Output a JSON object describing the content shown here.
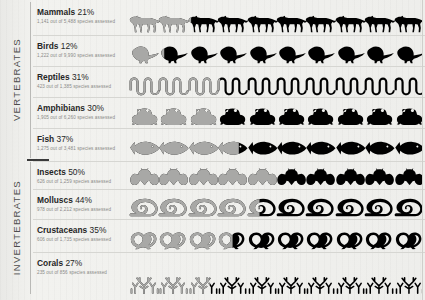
{
  "groups": [
    {
      "label": "VERTEBRATES",
      "name": "group-vertebrates"
    },
    {
      "label": "INVERTEBRATES",
      "name": "group-invertebrates"
    }
  ],
  "rows": [
    {
      "name": "row-mammals",
      "title": "Mammals",
      "percent_label": "21%",
      "percent": 21,
      "subtitle": "1,141 out of 5,488 species assessed",
      "threatened": 1141,
      "assessed": 5488,
      "icon": "wolf-icon",
      "icon_count": 10
    },
    {
      "name": "row-birds",
      "title": "Birds",
      "percent_label": "12%",
      "percent": 12,
      "subtitle": "1,222 out of 9,990 species assessed",
      "threatened": 1222,
      "assessed": 9990,
      "icon": "bird-icon",
      "icon_count": 10
    },
    {
      "name": "row-reptiles",
      "title": "Reptiles",
      "percent_label": "31%",
      "percent": 31,
      "subtitle": "423 out of 1,385 species assessed",
      "threatened": 423,
      "assessed": 1385,
      "icon": "snake-icon",
      "icon_count": 10
    },
    {
      "name": "row-amphibians",
      "title": "Amphibians",
      "percent_label": "30%",
      "percent": 30,
      "subtitle": "1,905 out of 6,260 species assessed",
      "threatened": 1905,
      "assessed": 6260,
      "icon": "frog-icon",
      "icon_count": 10
    },
    {
      "name": "row-fish",
      "title": "Fish",
      "percent_label": "37%",
      "percent": 37,
      "subtitle": "1,275 out of 3,481 species assessed",
      "threatened": 1275,
      "assessed": 3481,
      "icon": "fish-icon",
      "icon_count": 10
    },
    {
      "name": "row-insects",
      "title": "Insects",
      "percent_label": "50%",
      "percent": 50,
      "subtitle": "626 out of 1,259 species assessed",
      "threatened": 626,
      "assessed": 1259,
      "icon": "insect-icon",
      "icon_count": 10
    },
    {
      "name": "row-molluscs",
      "title": "Molluscs",
      "percent_label": "44%",
      "percent": 44,
      "subtitle": "978 out of 2,212 species assessed",
      "threatened": 978,
      "assessed": 2212,
      "icon": "snail-icon",
      "icon_count": 10
    },
    {
      "name": "row-crustaceans",
      "title": "Crustaceans",
      "percent_label": "35%",
      "percent": 35,
      "subtitle": "606 out of 1,735 species assessed",
      "threatened": 606,
      "assessed": 1735,
      "icon": "shrimp-icon",
      "icon_count": 10
    },
    {
      "name": "row-corals",
      "title": "Corals",
      "percent_label": "27%",
      "percent": 27,
      "subtitle": "235 out of 856 species assessed",
      "threatened": 235,
      "assessed": 856,
      "icon": "coral-icon",
      "icon_count": 10
    }
  ],
  "colors": {
    "threatened": "#a8a8a6",
    "remaining": "#000000",
    "background": "#eeeeec",
    "rule": "#d6d6d2",
    "title_text": "#262626",
    "sub_text": "#8a8a88",
    "group_text": "#4d4d4d"
  },
  "chart_data": {
    "type": "bar",
    "xlabel": "",
    "ylabel": "",
    "categories": [
      "Mammals",
      "Birds",
      "Reptiles",
      "Amphibians",
      "Fish",
      "Insects",
      "Molluscs",
      "Crustaceans",
      "Corals"
    ],
    "values": [
      21,
      12,
      31,
      30,
      37,
      50,
      44,
      35,
      27
    ],
    "ylim": [
      0,
      100
    ],
    "grid": false,
    "legend": null,
    "series": [
      {
        "name": "Threatened (%)",
        "values": [
          21,
          12,
          31,
          30,
          37,
          50,
          44,
          35,
          27
        ]
      },
      {
        "name": "Threatened count",
        "values": [
          1141,
          1222,
          423,
          1905,
          1275,
          626,
          978,
          606,
          235
        ]
      },
      {
        "name": "Species assessed",
        "values": [
          5488,
          9990,
          1385,
          6260,
          3481,
          1259,
          2212,
          1735,
          856
        ]
      }
    ]
  }
}
